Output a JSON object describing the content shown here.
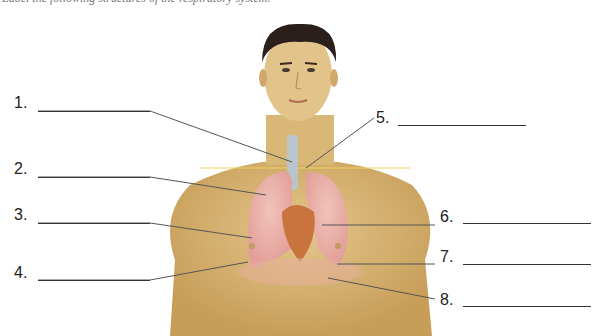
{
  "caption": "Label the following structures of the respiratory system.",
  "labels": [
    {
      "number": "1.",
      "side": "left"
    },
    {
      "number": "2.",
      "side": "left"
    },
    {
      "number": "3.",
      "side": "left"
    },
    {
      "number": "4.",
      "side": "left"
    },
    {
      "number": "5.",
      "side": "right"
    },
    {
      "number": "6.",
      "side": "right"
    },
    {
      "number": "7.",
      "side": "right"
    },
    {
      "number": "8.",
      "side": "right"
    }
  ],
  "colors": {
    "skin": "#d9b877",
    "skin_shadow": "#b8914f",
    "hair": "#2a1f1a",
    "lung": "#e8a9a4",
    "heart": "#c9733e",
    "trachea": "#b8c2c8",
    "leader_line": "#555555"
  }
}
